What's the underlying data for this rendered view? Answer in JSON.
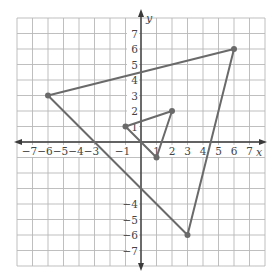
{
  "diagram": {
    "type": "coordinate-plane",
    "axes": {
      "x_label": "x",
      "y_label": "y",
      "x_range": [
        -8,
        8
      ],
      "y_range": [
        -8,
        8
      ],
      "x_ticks": [
        "−7",
        "−6",
        "−5",
        "−4",
        "−3",
        "−1",
        "1",
        "2",
        "3",
        "4",
        "5",
        "6",
        "7"
      ],
      "x_tick_values": [
        -7,
        -6,
        -5,
        -4,
        -3,
        -1,
        1,
        2,
        3,
        4,
        5,
        6,
        7
      ],
      "y_ticks": [
        "7",
        "6",
        "5",
        "4",
        "3",
        "2",
        "1",
        "−4",
        "−5",
        "−6",
        "−7"
      ],
      "y_tick_values": [
        7,
        6,
        5,
        4,
        3,
        2,
        1,
        -4,
        -5,
        -6,
        -7
      ]
    },
    "shapes": [
      {
        "name": "large-triangle",
        "vertices": [
          [
            -6,
            3
          ],
          [
            6,
            6
          ],
          [
            3,
            -6
          ]
        ],
        "color": "#6a6a6a"
      },
      {
        "name": "small-triangle",
        "vertices": [
          [
            -1,
            1
          ],
          [
            2,
            2
          ],
          [
            1,
            -1
          ]
        ],
        "color": "#6a6a6a"
      }
    ],
    "colors": {
      "grid": "#b8b8b8",
      "axis": "#3a3a3a",
      "shape": "#6a6a6a"
    }
  }
}
